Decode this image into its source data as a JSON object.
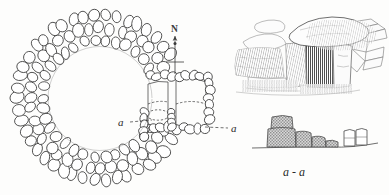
{
  "figure": {
    "type": "archaeological-plan-section-perspective",
    "background_color": "#fdfdfc",
    "ink_color": "#2b2b2b",
    "stone_fill": "#ffffff",
    "section_fill": "#b8b8b8"
  },
  "plan": {
    "name": "plan-view-stone-ring",
    "description": "Circular drystone ring cairn with rectangular passage chamber on the east side",
    "north_arrow_label": "N",
    "section_label_left": "a",
    "section_label_right": "a",
    "ring": {
      "center_x": 100,
      "center_y": 98,
      "outer_radius": 88,
      "inner_radius": 52,
      "stone_rows": 3
    },
    "passage": {
      "x": 150,
      "y": 78,
      "width": 58,
      "height": 48
    }
  },
  "perspective": {
    "name": "perspective-sketch-chamber",
    "description": "Pencil sketch of megalithic chamber entrance with capstone, orthostats and dark doorway",
    "capstone": "capstone",
    "doorway": "dark-doorway",
    "wall": "drystone-walling"
  },
  "section": {
    "name": "cross-section-a-a",
    "label": "a - a",
    "ground_line": true,
    "blocks": [
      {
        "id": "upper-block",
        "filled": true
      },
      {
        "id": "main-orthostat",
        "filled": true
      },
      {
        "id": "step-block-1",
        "filled": true
      },
      {
        "id": "step-block-2",
        "filled": true
      },
      {
        "id": "step-block-3",
        "filled": true
      },
      {
        "id": "outline-block-1",
        "filled": false
      },
      {
        "id": "outline-block-2",
        "filled": false
      }
    ]
  }
}
